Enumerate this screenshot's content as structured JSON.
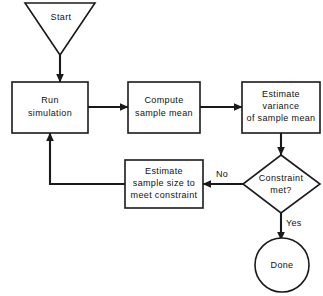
{
  "diagram": {
    "type": "flowchart",
    "colors": {
      "stroke": "#1a1a1a",
      "fill": "#ffffff",
      "text": "#111111",
      "background": "#ffffff"
    },
    "nodes": [
      {
        "id": "start",
        "shape": "inverted-triangle",
        "label": "Start",
        "lines": [
          "Start"
        ],
        "x": 60,
        "y": 29
      },
      {
        "id": "run-simulation",
        "shape": "rectangle",
        "label": "Run simulation",
        "lines": [
          "Run",
          "simulation"
        ],
        "x": 50,
        "y": 107
      },
      {
        "id": "compute-sample-mean",
        "shape": "rectangle",
        "label": "Compute sample mean",
        "lines": [
          "Compute",
          "sample  mean"
        ],
        "x": 164,
        "y": 107
      },
      {
        "id": "estimate-variance",
        "shape": "rectangle",
        "label": "Estimate variance of sample mean",
        "lines": [
          "Estimate",
          "variance",
          "of  sample  mean"
        ],
        "x": 281,
        "y": 107
      },
      {
        "id": "constraint-met",
        "shape": "diamond",
        "label": "Constraint met?",
        "lines": [
          "Constraint",
          "met?"
        ],
        "x": 281,
        "y": 184
      },
      {
        "id": "estimate-sample-size",
        "shape": "rectangle",
        "label": "Estimate sample size to meet constraint",
        "lines": [
          "Estimate",
          "sample  size  to",
          "meet  constraint"
        ],
        "x": 164,
        "y": 184
      },
      {
        "id": "done",
        "shape": "circle",
        "label": "Done",
        "lines": [
          "Done"
        ],
        "x": 281,
        "y": 265
      }
    ],
    "edges": [
      {
        "id": "start-to-run",
        "from": "start",
        "to": "run-simulation",
        "label": ""
      },
      {
        "id": "run-to-compute",
        "from": "run-simulation",
        "to": "compute-sample-mean",
        "label": ""
      },
      {
        "id": "compute-to-variance",
        "from": "compute-sample-mean",
        "to": "estimate-variance",
        "label": ""
      },
      {
        "id": "variance-to-constraint",
        "from": "estimate-variance",
        "to": "constraint-met",
        "label": ""
      },
      {
        "id": "constraint-to-estimate-size",
        "from": "constraint-met",
        "to": "estimate-sample-size",
        "label": "No"
      },
      {
        "id": "estimate-size-to-run",
        "from": "estimate-sample-size",
        "to": "run-simulation",
        "label": ""
      },
      {
        "id": "constraint-to-done",
        "from": "constraint-met",
        "to": "done",
        "label": "Yes"
      }
    ]
  }
}
